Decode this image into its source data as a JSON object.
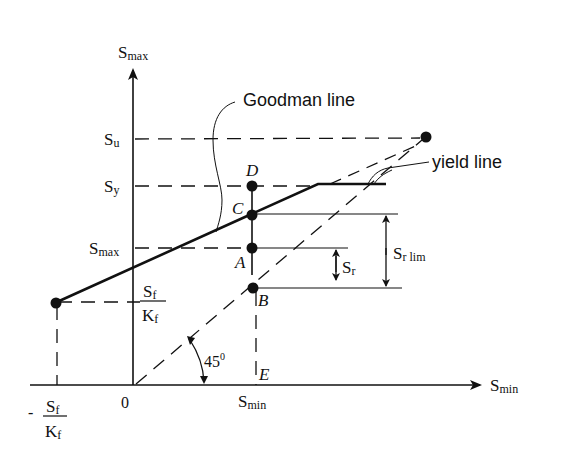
{
  "diagram": {
    "type": "goodman-diagram",
    "axes": {
      "y_label_main": "S",
      "y_label_sub": "max",
      "x_label_main": "S",
      "x_label_sub": "min",
      "origin": "0"
    },
    "y_ticks": [
      {
        "main": "S",
        "sub": "u",
        "name": "tick-su"
      },
      {
        "main": "S",
        "sub": "y",
        "name": "tick-sy"
      },
      {
        "main": "S",
        "sub": "max",
        "name": "tick-smax"
      }
    ],
    "fraction_y": {
      "num_main": "S",
      "num_sub": "f",
      "den_main": "K",
      "den_sub": "f"
    },
    "fraction_x": {
      "sign": "-",
      "num_main": "S",
      "num_sub": "f",
      "den_main": "K",
      "den_sub": "f"
    },
    "x_tick": {
      "main": "S",
      "sub": "min"
    },
    "points": {
      "A": "A",
      "B": "B",
      "C": "C",
      "D": "D",
      "E": "E"
    },
    "annotations": {
      "goodman": "Goodman line",
      "yield": "yield line",
      "angle_main": "45",
      "angle_sup": "0",
      "sr_main": "S",
      "sr_sub": "r",
      "srlim_main": "S",
      "srlim_sub": "r lim"
    }
  }
}
